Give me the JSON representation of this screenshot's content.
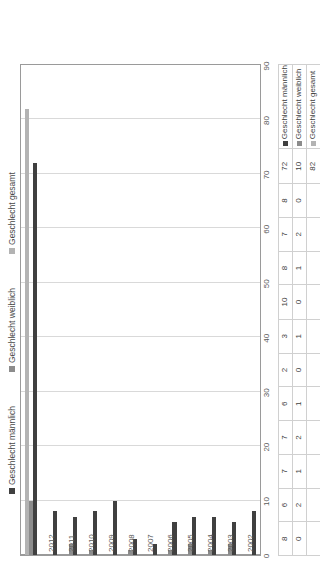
{
  "legend": {
    "items": [
      {
        "label": "Geschlecht männlich",
        "color": "#404040",
        "key": "male"
      },
      {
        "label": "Geschlecht weiblich",
        "color": "#8c8c8c",
        "key": "female"
      },
      {
        "label": "Geschlecht gesamt",
        "color": "#b3b3b3",
        "key": "total"
      }
    ]
  },
  "chart_data": {
    "type": "bar",
    "orientation": "horizontal",
    "title": "",
    "xlabel": "",
    "ylabel": "",
    "ylim": [
      0,
      90
    ],
    "yticks": [
      0,
      10,
      20,
      30,
      40,
      50,
      60,
      70,
      80,
      90
    ],
    "grid": true,
    "legend_position": "top",
    "categories": [
      "2002",
      "2003",
      "2004",
      "2005",
      "2006",
      "2007",
      "2008",
      "2009",
      "2010",
      "2011",
      "2012",
      ""
    ],
    "series": [
      {
        "name": "Geschlecht männlich",
        "color": "#404040",
        "values": [
          8,
          6,
          7,
          7,
          6,
          2,
          3,
          10,
          8,
          7,
          8,
          72
        ]
      },
      {
        "name": "Geschlecht weiblich",
        "color": "#8c8c8c",
        "values": [
          0,
          2,
          1,
          2,
          1,
          0,
          1,
          0,
          1,
          2,
          0,
          10
        ]
      },
      {
        "name": "Geschlecht gesamt",
        "color": "#b3b3b3",
        "values": [
          null,
          null,
          null,
          null,
          null,
          null,
          null,
          null,
          null,
          null,
          null,
          82
        ]
      }
    ]
  },
  "table": {
    "columns": [
      "2002",
      "2003",
      "2004",
      "2005",
      "2006",
      "2007",
      "2008",
      "2009",
      "2010",
      "2011",
      "2012",
      ""
    ],
    "rows": [
      {
        "header": "Geschlecht männlich",
        "color": "#404040",
        "values": [
          "8",
          "6",
          "7",
          "7",
          "6",
          "2",
          "3",
          "10",
          "8",
          "7",
          "8",
          "72"
        ]
      },
      {
        "header": "Geschlecht weiblich",
        "color": "#8c8c8c",
        "values": [
          "0",
          "2",
          "1",
          "2",
          "1",
          "0",
          "1",
          "0",
          "1",
          "2",
          "0",
          "10"
        ]
      },
      {
        "header": "Geschlecht gesamt",
        "color": "#b3b3b3",
        "values": [
          "",
          "",
          "",
          "",
          "",
          "",
          "",
          "",
          "",
          "",
          "",
          "82"
        ]
      }
    ]
  }
}
